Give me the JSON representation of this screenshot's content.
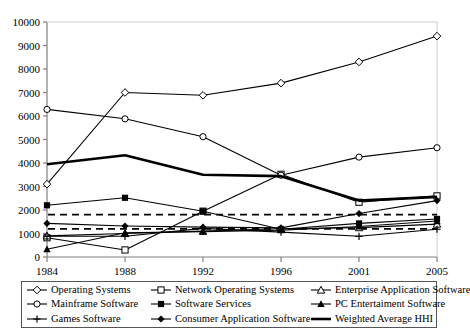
{
  "chart_data": {
    "type": "line",
    "title": "",
    "xlabel": "",
    "ylabel": "",
    "categories": [
      "1984",
      "1988",
      "1992",
      "1996",
      "2001",
      "2005"
    ],
    "ylim": [
      0,
      10000
    ],
    "ytick_values": [
      0,
      1000,
      2000,
      3000,
      4000,
      5000,
      6000,
      7000,
      8000,
      9000,
      10000
    ],
    "ytick_labels": [
      "0",
      "1000",
      "2000",
      "3000",
      "4000",
      "5000",
      "6000",
      "7000",
      "8000",
      "9000",
      "10000"
    ],
    "grid": false,
    "legend_position": "bottom",
    "series": [
      {
        "name": "Operating Systems",
        "marker": "diamond-open",
        "line": "solid",
        "values": [
          3100,
          7000,
          6880,
          7400,
          8300,
          9400
        ]
      },
      {
        "name": "Network Operating Systems",
        "marker": "square-open",
        "line": "solid",
        "values": [
          820,
          300,
          1950,
          3520,
          2330,
          2600
        ]
      },
      {
        "name": "Enterprise Application Software",
        "marker": "triangle-open",
        "line": "solid",
        "values": [
          900,
          1000,
          1100,
          1200,
          1250,
          1400
        ]
      },
      {
        "name": "Mainframe Software",
        "marker": "circle-open",
        "line": "solid",
        "values": [
          6280,
          5880,
          5120,
          3480,
          4250,
          4650
        ]
      },
      {
        "name": "Software Services",
        "marker": "square-filled",
        "line": "solid",
        "values": [
          2200,
          2520,
          1950,
          1180,
          1430,
          1620
        ]
      },
      {
        "name": "PC Entertaiment Software",
        "marker": "triangle-filled",
        "line": "solid",
        "values": [
          330,
          1030,
          1080,
          1140,
          1300,
          1530
        ]
      },
      {
        "name": "Games Software",
        "marker": "plus",
        "line": "solid",
        "values": [
          880,
          880,
          1220,
          1060,
          880,
          1180
        ]
      },
      {
        "name": "Consumer Application Software",
        "marker": "diamond-filled",
        "line": "solid",
        "values": [
          1430,
          1320,
          1270,
          1240,
          1850,
          2400
        ]
      },
      {
        "name": "Weighted Average HHI",
        "marker": "none",
        "line": "thick",
        "values": [
          3950,
          4330,
          3500,
          3440,
          2400,
          2560
        ]
      }
    ],
    "reference_lines": [
      {
        "name": "upper-dashed-threshold",
        "value": 1800,
        "style": "dashed"
      },
      {
        "name": "lower-dashed-threshold",
        "value": 1200,
        "style": "dashed"
      }
    ]
  },
  "legend": {
    "items": [
      {
        "label": "Operating Systems",
        "marker": "diamond-open"
      },
      {
        "label": "Network Operating Systems",
        "marker": "square-open"
      },
      {
        "label": "Enterprise Application Software",
        "marker": "triangle-open"
      },
      {
        "label": "Mainframe Software",
        "marker": "circle-open"
      },
      {
        "label": "Software Services",
        "marker": "square-filled"
      },
      {
        "label": "PC Entertaiment Software",
        "marker": "triangle-filled"
      },
      {
        "label": "Games Software",
        "marker": "plus"
      },
      {
        "label": "Consumer Application Software",
        "marker": "diamond-filled"
      },
      {
        "label": "Weighted Average HHI",
        "marker": "none"
      }
    ]
  },
  "colors": {
    "line": "#000000",
    "axis": "#808080",
    "background": "#ffffff",
    "legend_border": "#555555"
  }
}
